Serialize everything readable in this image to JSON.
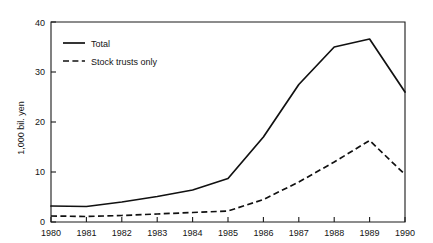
{
  "chart_data": {
    "type": "line",
    "title": "",
    "subtitle": "",
    "xlabel": "",
    "ylabel": "1,000 bil. yen",
    "x": [
      1980,
      1981,
      1982,
      1983,
      1984,
      1985,
      1986,
      1987,
      1988,
      1989,
      1990
    ],
    "categories": [
      "1980",
      "1981",
      "1982",
      "1983",
      "1984",
      "1985",
      "1986",
      "1987",
      "1988",
      "1989",
      "1990"
    ],
    "xlim": [
      1980,
      1990
    ],
    "ylim": [
      0,
      40
    ],
    "yticks": [
      0,
      10,
      20,
      30,
      40
    ],
    "ytick_labels": [
      "0",
      "10",
      "20",
      "30",
      "40"
    ],
    "xticks": [
      1980,
      1981,
      1982,
      1983,
      1984,
      1985,
      1986,
      1987,
      1988,
      1989,
      1990
    ],
    "xtick_labels": [
      "1980",
      "1981",
      "1982",
      "1983",
      "1984",
      "1985",
      "1986",
      "1987",
      "1988",
      "1989",
      "1990"
    ],
    "grid": false,
    "legend_position": "top-left-inside",
    "series": [
      {
        "name": "Total",
        "style": "solid",
        "color": "#111111",
        "values": [
          3.2,
          3.1,
          4.0,
          5.1,
          6.4,
          8.7,
          17.0,
          27.5,
          35.0,
          36.6,
          26.0
        ]
      },
      {
        "name": "Stock trusts only",
        "style": "dashed",
        "color": "#111111",
        "values": [
          1.2,
          1.1,
          1.3,
          1.6,
          1.9,
          2.2,
          4.5,
          8.0,
          12.0,
          16.3,
          9.5
        ]
      }
    ],
    "annotations": []
  },
  "legend": {
    "entries": [
      {
        "label": "Total",
        "style": "solid"
      },
      {
        "label": "Stock trusts only",
        "style": "dashed"
      }
    ]
  },
  "axes": {
    "y_title": "1,000 bil. yen",
    "y_tick_0": "0",
    "y_tick_1": "10",
    "y_tick_2": "20",
    "y_tick_3": "30",
    "y_tick_4": "40",
    "x_tick_0": "1980",
    "x_tick_1": "1981",
    "x_tick_2": "1982",
    "x_tick_3": "1983",
    "x_tick_4": "1984",
    "x_tick_5": "1985",
    "x_tick_6": "1986",
    "x_tick_7": "1987",
    "x_tick_8": "1988",
    "x_tick_9": "1989",
    "x_tick_10": "1990"
  },
  "colors": {
    "line": "#111111",
    "axis": "#1a1a1a",
    "background": "#ffffff",
    "text": "#141414"
  }
}
